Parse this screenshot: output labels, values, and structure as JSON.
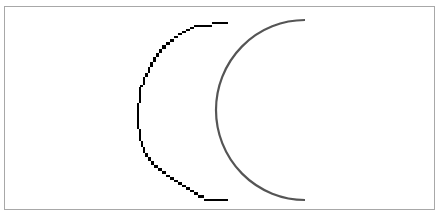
{
  "diagram": {
    "frame_color": "#a8a8a8",
    "shapes": [
      {
        "name": "aliased-arc",
        "style": "jagged pixelated stroke",
        "color": "#000000",
        "stroke_width": 2,
        "start": [
          228,
          22
        ],
        "end": [
          228,
          201
        ],
        "leftmost": [
          137,
          111
        ]
      },
      {
        "name": "antialiased-arc",
        "style": "smooth anti-aliased stroke",
        "color": "#555555",
        "stroke_width": 2,
        "start": [
          305,
          20
        ],
        "end": [
          305,
          200
        ],
        "leftmost": [
          216,
          110
        ]
      }
    ]
  }
}
